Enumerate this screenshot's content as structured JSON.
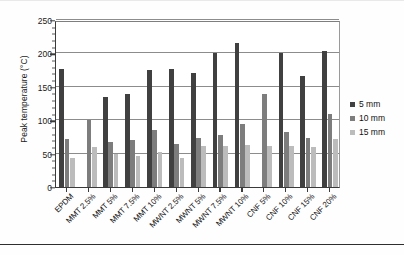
{
  "chart_data": {
    "type": "bar",
    "title": "",
    "xlabel": "",
    "ylabel": "Peak temperature (°C)",
    "ylim": [
      0,
      250
    ],
    "ytick_values": [
      0,
      50,
      100,
      150,
      200,
      250
    ],
    "ytick_labels": [
      "0",
      "50",
      "100",
      "150",
      "200",
      "250"
    ],
    "grid": true,
    "legend_position": "right",
    "categories": [
      "EPDM",
      "MMT 2.5%",
      "MMT 5%",
      "MMT 7.5%",
      "MMT 10%",
      "MWNT 2.5%",
      "MWNT 5%",
      "MWNT 7.5%",
      "MWNT 10%",
      "CNF 5%",
      "CNF 10%",
      "CNF 15%",
      "CNF 20%"
    ],
    "series": [
      {
        "name": "5 mm",
        "color": "#404040",
        "values": [
          176,
          0,
          135,
          139,
          175,
          176,
          171,
          200,
          215,
          0,
          200,
          166,
          203
        ]
      },
      {
        "name": "10 mm",
        "color": "#7d7d7d",
        "values": [
          72,
          100,
          68,
          70,
          86,
          64,
          74,
          78,
          94,
          139,
          83,
          73,
          110
        ]
      },
      {
        "name": "15 mm",
        "color": "#bcbcbc",
        "values": [
          44,
          60,
          50,
          46,
          53,
          43,
          62,
          61,
          63,
          62,
          61,
          60,
          72
        ]
      }
    ]
  },
  "legend": {
    "items": [
      {
        "label": "5 mm"
      },
      {
        "label": "10 mm"
      },
      {
        "label": "15 mm"
      }
    ]
  }
}
